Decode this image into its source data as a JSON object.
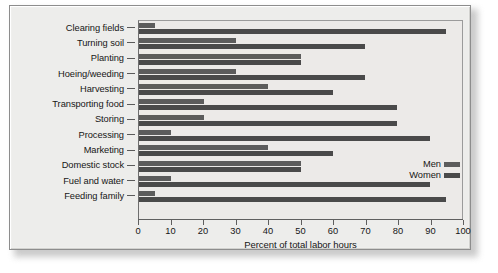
{
  "chart_data": {
    "type": "bar",
    "orientation": "horizontal",
    "title": "",
    "xlabel": "Percent of total labor hours",
    "ylabel": "",
    "xlim": [
      0,
      100
    ],
    "xticks": [
      0,
      10,
      20,
      30,
      40,
      50,
      60,
      70,
      80,
      90,
      100
    ],
    "xtick_labels": [
      "0",
      "10",
      "20",
      "30",
      "40",
      "50",
      "60",
      "70",
      "80",
      "90",
      "100"
    ],
    "grid": false,
    "legend_position": "center-right",
    "categories": [
      "Clearing fields",
      "Turning soil",
      "Planting",
      "Hoeing/weeding",
      "Harvesting",
      "Transporting food",
      "Storing",
      "Processing",
      "Marketing",
      "Domestic stock",
      "Fuel and water",
      "Feeding family"
    ],
    "series": [
      {
        "name": "Men",
        "color": "#5c5c5c",
        "values": [
          5,
          30,
          50,
          30,
          40,
          20,
          20,
          10,
          40,
          50,
          10,
          5
        ]
      },
      {
        "name": "Women",
        "color": "#4a4a4a",
        "values": [
          95,
          70,
          50,
          70,
          60,
          80,
          80,
          90,
          60,
          50,
          90,
          95
        ]
      }
    ]
  },
  "legend": {
    "entries": [
      {
        "label": "Men"
      },
      {
        "label": "Women"
      }
    ]
  },
  "colors": {
    "men_bar": "#5c5c5c",
    "women_bar": "#4a4a4a",
    "plot_background": "#eceae8",
    "figure_background": "#ededeb",
    "frame_border": "#8d8d8d",
    "axis": "#5f5f5f",
    "text": "#161616"
  }
}
